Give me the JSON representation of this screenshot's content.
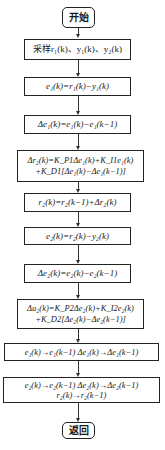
{
  "flowchart": {
    "start": "开始",
    "steps": [
      {
        "id": "sample",
        "lines": [
          "采样r₁(k)、y₁(k)、y₂(k)"
        ]
      },
      {
        "id": "e1",
        "lines": [
          "e₁(k)=r₁(k)−y₁(k)"
        ]
      },
      {
        "id": "delta-e1",
        "lines": [
          "Δe₁(k)=e₁(k)−e₁(k−1)"
        ]
      },
      {
        "id": "delta-r2",
        "lines": [
          "Δr₂(k)=K_P1Δe₁(k)+K_I1e₁(k)",
          "+K_D1[Δe₁(k)−Δe₁(k−1)]"
        ]
      },
      {
        "id": "r2",
        "lines": [
          "r₂(k)=r₂(k−1)+Δr₂(k)"
        ]
      },
      {
        "id": "e2",
        "lines": [
          "e₂(k)=r₂(k)−y₂(k)"
        ]
      },
      {
        "id": "delta-e2",
        "lines": [
          "Δe₂(k)=e₂(k)−e₂(k−1)"
        ]
      },
      {
        "id": "delta-u2",
        "lines": [
          "Δu₂(k)=K_P2Δe₂(k)+K_I2e₂(k)",
          "+K_D2[Δe₂(k)−Δe₂(k−1)]"
        ]
      },
      {
        "id": "shift-1",
        "lines": [
          "e₁(k)→e₁(k−1)  Δe₁(k)→Δe₁(k−1)"
        ]
      },
      {
        "id": "shift-2",
        "lines": [
          "e₂(k)→e₂(k−1)  Δe₂(k)→Δe₂(k−1)",
          "r₂(k)→r₂(k−1)"
        ]
      }
    ],
    "end": "返回"
  }
}
